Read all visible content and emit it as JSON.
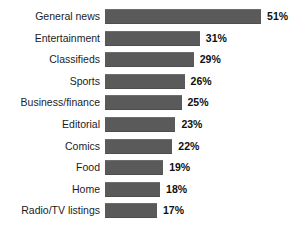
{
  "chart_data": {
    "type": "bar",
    "orientation": "horizontal",
    "title": "",
    "subtitle": "",
    "xlabel": "",
    "ylabel": "",
    "grid": false,
    "legend": null,
    "xlim": [
      0,
      51
    ],
    "value_suffix": "%",
    "categories": [
      "General news",
      "Entertainment",
      "Classifieds",
      "Sports",
      "Business/finance",
      "Editorial",
      "Comics",
      "Food",
      "Home",
      "Radio/TV listings"
    ],
    "values": [
      51,
      31,
      29,
      26,
      25,
      23,
      22,
      19,
      18,
      17
    ],
    "value_labels": [
      "51%",
      "31%",
      "29%",
      "26%",
      "25%",
      "23%",
      "22%",
      "19%",
      "18%",
      "17%"
    ],
    "colors": {
      "bar": "#5a5a5a",
      "background": "#ffffff",
      "category_text": "#1c1c1c",
      "value_text": "#0f0f0f"
    }
  }
}
